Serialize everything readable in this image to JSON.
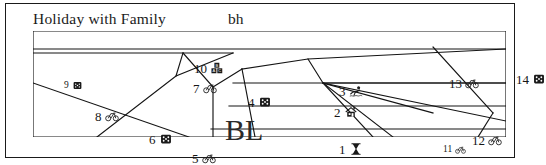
{
  "map": {
    "title": "Holiday with Family",
    "subtitle": "bh",
    "center_label": "BL",
    "outline_color": "#141414",
    "background_color": "#ffffff",
    "regions": [
      {
        "number": "1",
        "icon": "hourglass-icon",
        "x": 306,
        "y": 111,
        "small": false
      },
      {
        "number": "2",
        "icon": "house-icon",
        "x": 301,
        "y": 74,
        "small": false
      },
      {
        "number": "3",
        "icon": "swimmer-icon",
        "x": 306,
        "y": 53,
        "small": false
      },
      {
        "number": "4",
        "icon": "dice-icon",
        "x": 215,
        "y": 64,
        "small": false
      },
      {
        "number": "5",
        "icon": "bicycle-icon",
        "x": 159,
        "y": 120,
        "small": false
      },
      {
        "number": "6",
        "icon": "dice-icon",
        "x": 116,
        "y": 101,
        "small": false
      },
      {
        "number": "7",
        "icon": "bicycle-icon",
        "x": 160,
        "y": 50,
        "small": false
      },
      {
        "number": "8",
        "icon": "bicycle-icon",
        "x": 62,
        "y": 78,
        "small": false
      },
      {
        "number": "9",
        "icon": "dice-icon",
        "x": 31,
        "y": 49,
        "small": true
      },
      {
        "number": "10",
        "icon": "blocks-icon",
        "x": 161,
        "y": 30,
        "small": false
      },
      {
        "number": "11",
        "icon": "bicycle-icon",
        "x": 410,
        "y": 113,
        "small": true
      },
      {
        "number": "12",
        "icon": "bicycle-icon",
        "x": 439,
        "y": 102,
        "small": false
      },
      {
        "number": "13",
        "icon": "bicycle-icon",
        "x": 416,
        "y": 45,
        "small": false
      },
      {
        "number": "14",
        "icon": "dice-icon",
        "x": 483,
        "y": 41,
        "small": false
      }
    ],
    "lines": [
      "M 0,0 L 473,0 L 473,106 L 0,106 Z",
      "M 0,18 L 473,18",
      "M 0,22 L 200,22",
      "M 0,52 L 156,106",
      "M 64,106 L 143,45 L 200,22",
      "M 143,45 L 150,22",
      "M 150,22 L 180,56 L 209,38",
      "M 180,56 L 180,106",
      "M 209,38 L 275,28 L 473,18",
      "M 209,38 L 222,106",
      "M 275,28 L 290,52 L 473,52",
      "M 290,52 L 360,106",
      "M 290,52 L 340,106",
      "M 290,52 L 400,82",
      "M 290,52 L 473,90",
      "M 200,52 L 473,52",
      "M 196,75 L 473,75",
      "M 178,98 L 473,98",
      "M 400,16 L 460,82",
      "M 460,82 L 445,106"
    ]
  }
}
